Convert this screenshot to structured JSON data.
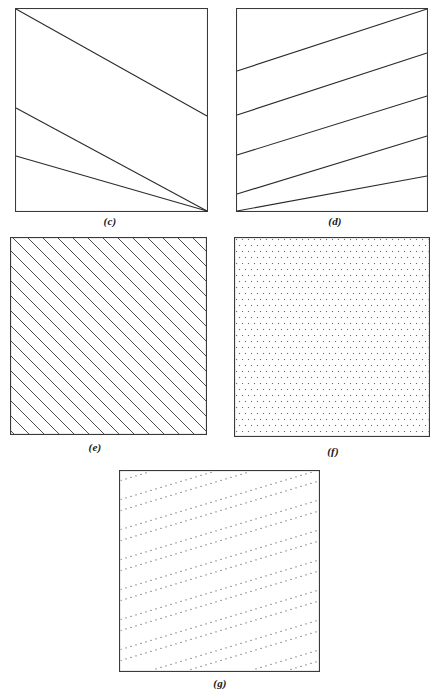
{
  "document": {
    "kind": "textbook-figure-plate",
    "background_color": "#ffffff",
    "ink_color": "#262626"
  },
  "panels": [
    {
      "id": "c",
      "caption": "(c)",
      "description": "square outline with three widely spaced straight lines descending to the right",
      "pattern": "coarse-lines-descending",
      "line_color": "#2b2b2b",
      "line_width": 1,
      "line_count": 3,
      "frame": {
        "x": 15,
        "y": 8,
        "width": 193,
        "height": 204
      }
    },
    {
      "id": "d",
      "caption": "(d)",
      "description": "square outline with five straight lines ascending to the right",
      "pattern": "coarse-lines-ascending",
      "line_color": "#2b2b2b",
      "line_width": 1,
      "line_count": 5,
      "frame": {
        "x": 236,
        "y": 8,
        "width": 192,
        "height": 204
      }
    },
    {
      "id": "e",
      "caption": "(e)",
      "description": "square filled with dense 45 degree hatching descending to the right",
      "pattern": "dense-diagonal-hatch",
      "line_color": "#3a3a3a",
      "line_width": 1,
      "line_count": 26,
      "frame": {
        "x": 10,
        "y": 237,
        "width": 197,
        "height": 198
      }
    },
    {
      "id": "f",
      "caption": "(f)",
      "description": "square filled with a fine regular stipple of dots",
      "pattern": "dot-stipple-grid",
      "dot_color": "#6b6b6b",
      "dot_size": 1,
      "dot_spacing": 6,
      "frame": {
        "x": 234,
        "y": 237,
        "width": 196,
        "height": 200
      }
    },
    {
      "id": "g",
      "caption": "(g)",
      "description": "square filled with paired dotted lines ascending to the right",
      "pattern": "dotted-lines-ascending",
      "dot_color": "#5d5d5d",
      "dot_size": 1,
      "line_count": 14,
      "frame": {
        "x": 119,
        "y": 470,
        "width": 201,
        "height": 202
      }
    }
  ],
  "panel_c_lines": [
    {
      "x1": 0,
      "y1": 0,
      "x2": 193,
      "y2": 108
    },
    {
      "x1": 0,
      "y1": 100,
      "x2": 193,
      "y2": 207
    },
    {
      "x1": 0,
      "y1": 150,
      "x2": 193,
      "y2": 204
    }
  ],
  "panel_d_lines": [
    {
      "x1": 0,
      "y1": 64,
      "x2": 192,
      "y2": 2
    },
    {
      "x1": 0,
      "y1": 108,
      "x2": 192,
      "y2": 46
    },
    {
      "x1": 0,
      "y1": 147,
      "x2": 192,
      "y2": 88
    },
    {
      "x1": 0,
      "y1": 186,
      "x2": 192,
      "y2": 128
    },
    {
      "x1": 0,
      "y1": 204,
      "x2": 192,
      "y2": 168
    }
  ]
}
